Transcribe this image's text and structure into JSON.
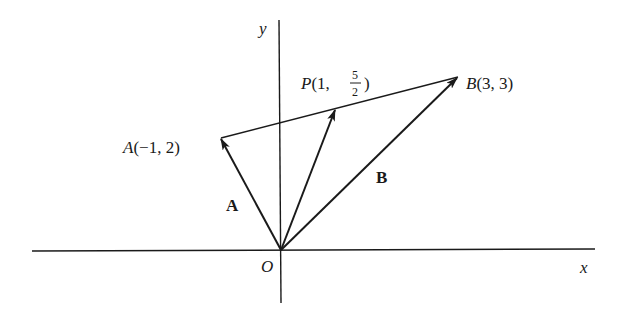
{
  "figure": {
    "type": "vector-diagram",
    "axes": {
      "x_label": "x",
      "y_label": "y",
      "origin_label": "O"
    },
    "points": [
      {
        "id": "A",
        "label_prefix": "A",
        "label_coords": "(−1, 2)",
        "x": -1,
        "y": 2
      },
      {
        "id": "P",
        "label_prefix": "P",
        "label_coords_open": "(1, ",
        "frac_num": "5",
        "frac_den": "2",
        "label_coords_close": ")",
        "x": 1,
        "y": 2.5
      },
      {
        "id": "B",
        "label_prefix": "B",
        "label_coords": "(3, 3)",
        "x": 3,
        "y": 3
      }
    ],
    "vectors": [
      {
        "name": "A",
        "from": "O",
        "to": "A",
        "label": "A"
      },
      {
        "name": "P",
        "from": "O",
        "to": "P",
        "label": ""
      },
      {
        "name": "B",
        "from": "O",
        "to": "B",
        "label": "B"
      }
    ],
    "segment": {
      "from": "A",
      "to": "B"
    },
    "colors": {
      "ink": "#1a1a1a",
      "background": "#ffffff"
    }
  }
}
